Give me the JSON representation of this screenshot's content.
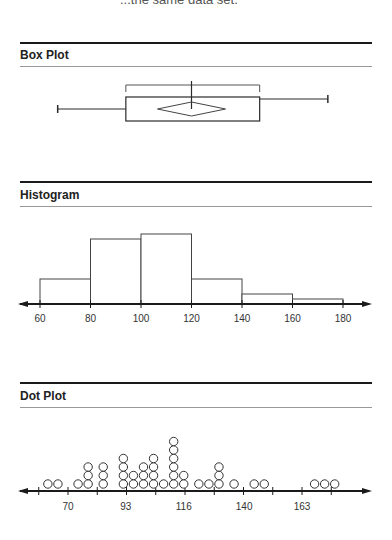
{
  "cut_top_text": "...the same data set.",
  "sections": [
    {
      "title": "Box Plot"
    },
    {
      "title": "Histogram"
    },
    {
      "title": "Dot Plot"
    }
  ],
  "chart_data": [
    {
      "type": "box",
      "title": "Box Plot",
      "min": 67,
      "q1": 94,
      "median": 120,
      "mean": 120,
      "q3": 147,
      "max": 174,
      "bracket": {
        "from": 94,
        "to": 147
      },
      "scale": {
        "x0": 60,
        "px0": 40,
        "px_per_unit": 2.525
      }
    },
    {
      "type": "bar",
      "title": "Histogram",
      "bins": [
        {
          "from": 60,
          "to": 80,
          "height": 5
        },
        {
          "from": 80,
          "to": 100,
          "height": 13
        },
        {
          "from": 100,
          "to": 120,
          "height": 14
        },
        {
          "from": 120,
          "to": 140,
          "height": 5
        },
        {
          "from": 140,
          "to": 160,
          "height": 2
        },
        {
          "from": 160,
          "to": 180,
          "height": 1
        }
      ],
      "categories": [
        "60-80",
        "80-100",
        "100-120",
        "120-140",
        "140-160",
        "160-180"
      ],
      "values": [
        5,
        13,
        14,
        5,
        2,
        1
      ],
      "xticks": [
        60,
        80,
        100,
        120,
        140,
        160,
        180
      ],
      "xlabel": "",
      "ylabel": ""
    },
    {
      "type": "scatter",
      "title": "Dot Plot",
      "xticks": [
        70,
        93,
        116,
        140,
        163
      ],
      "points": [
        {
          "x": 62,
          "count": 1
        },
        {
          "x": 66,
          "count": 1
        },
        {
          "x": 74,
          "count": 1
        },
        {
          "x": 78,
          "count": 3
        },
        {
          "x": 84,
          "count": 3
        },
        {
          "x": 92,
          "count": 4
        },
        {
          "x": 96,
          "count": 2
        },
        {
          "x": 100,
          "count": 3
        },
        {
          "x": 104,
          "count": 4
        },
        {
          "x": 108,
          "count": 1
        },
        {
          "x": 112,
          "count": 6
        },
        {
          "x": 116,
          "count": 2
        },
        {
          "x": 122,
          "count": 1
        },
        {
          "x": 126,
          "count": 1
        },
        {
          "x": 130,
          "count": 3
        },
        {
          "x": 136,
          "count": 1
        },
        {
          "x": 144,
          "count": 1
        },
        {
          "x": 148,
          "count": 1
        },
        {
          "x": 168,
          "count": 1
        },
        {
          "x": 172,
          "count": 1
        },
        {
          "x": 176,
          "count": 1
        }
      ]
    }
  ]
}
